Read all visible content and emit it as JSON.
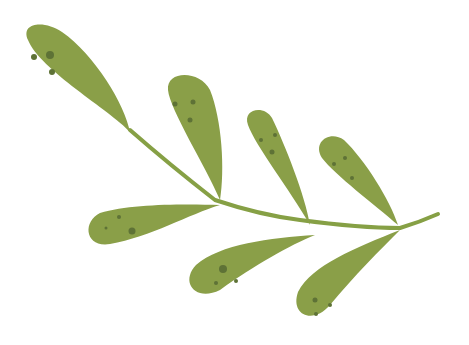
{
  "image": {
    "subject": "green leafy branch illustration",
    "background": "#ffffff",
    "leaf_color": "#8a9f48",
    "spot_color": "#5e7236",
    "stem_color": "#86a045",
    "leaf_count": 7
  },
  "branch": {
    "stem": "M 130 130 Q 170 165 215 200 Q 260 215 300 220 Q 360 228 400 228 Q 420 222 438 214",
    "leaves": [
      {
        "id": "leaf-1",
        "path": "M 130 132 C 110 110, 40 70, 28 40 C 20 22, 45 20, 62 32 C 95 55, 125 105, 130 132 Z",
        "spots": [
          [
            34,
            57,
            3
          ],
          [
            50,
            55,
            4
          ],
          [
            52,
            72,
            3
          ]
        ]
      },
      {
        "id": "leaf-2",
        "path": "M 220 200 C 205 165, 170 110, 168 90 C 166 70, 200 70, 210 90 C 222 120, 225 170, 220 200 Z",
        "spots": [
          [
            175,
            104,
            2.5
          ],
          [
            193,
            102,
            2.5
          ],
          [
            190,
            120,
            2.5
          ]
        ]
      },
      {
        "id": "leaf-3",
        "path": "M 310 225 C 290 190, 255 145, 248 125 C 242 108, 265 105, 272 118 C 285 145, 305 195, 310 225 Z",
        "spots": [
          [
            261,
            140,
            2
          ],
          [
            275,
            135,
            2
          ],
          [
            272,
            152,
            2.5
          ]
        ]
      },
      {
        "id": "leaf-4",
        "path": "M 398 225 C 375 205, 335 175, 322 158 C 312 142, 330 130, 344 140 C 365 160, 390 200, 398 225 Z",
        "spots": [
          [
            334,
            164,
            2
          ],
          [
            345,
            158,
            2
          ],
          [
            352,
            178,
            2
          ]
        ]
      },
      {
        "id": "leaf-5",
        "path": "M 220 205 C 190 214, 150 237, 110 244 C 85 248, 82 222, 100 213 C 130 204, 180 204, 220 205 Z",
        "spots": [
          [
            106,
            228,
            1.5
          ],
          [
            119,
            217,
            2
          ],
          [
            132,
            231,
            3.5
          ]
        ]
      },
      {
        "id": "leaf-6",
        "path": "M 315 235 C 290 245, 255 265, 220 290 C 195 302, 180 282, 196 265 C 220 244, 270 238, 315 235 Z",
        "spots": [
          [
            223,
            269,
            4
          ],
          [
            216,
            283,
            2
          ],
          [
            236,
            281,
            2
          ]
        ]
      },
      {
        "id": "leaf-7",
        "path": "M 400 230 C 380 250, 355 275, 330 305 C 313 325, 290 315, 298 292 C 312 265, 355 248, 400 230 Z",
        "spots": [
          [
            315,
            300,
            2.5
          ],
          [
            330,
            305,
            2
          ],
          [
            316,
            314,
            2
          ]
        ]
      }
    ]
  }
}
